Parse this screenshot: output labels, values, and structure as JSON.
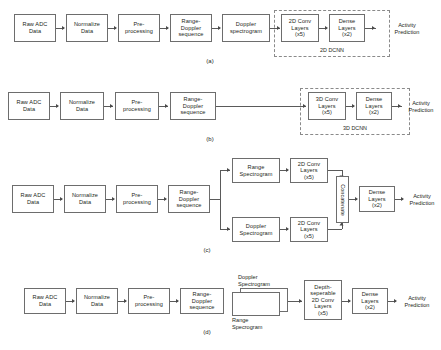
{
  "figure": {
    "background": "#ffffff",
    "box_border_color": "#6d6d6d",
    "dashed_border_color": "#8a8a8a",
    "text_color": "#231f20"
  },
  "common": {
    "raw_adc": "Raw ADC\nData",
    "normalize": "Normalize\nData",
    "preprocess": "Pre-\nprocessing",
    "rd_sequence": "Range-\nDoppler\nsequence",
    "dense_layers": "Dense\nLayers\n(x2)",
    "activity_prediction": "Activity\nPrediction"
  },
  "panel_a": {
    "caption": "(a)",
    "nodes": [
      "Raw ADC\nData",
      "Normalize\nData",
      "Pre-\nprocessing",
      "Range-\nDoppler\nsequence",
      "Doppler\nspectrogram",
      "2D Conv\nLayers\n(x5)",
      "Dense\nLayers\n(x2)"
    ],
    "output": "Activity\nPrediction",
    "group_label": "2D DCNN"
  },
  "panel_b": {
    "caption": "(b)",
    "nodes": [
      "Raw ADC\nData",
      "Normalize\nData",
      "Pre-\nprocessing",
      "Range-\nDoppler\nsequence",
      "3D Conv\nLayers\n(x5)",
      "Dense\nLayers\n(x2)"
    ],
    "output": "Activity\nPrediction",
    "group_label": "3D DCNN"
  },
  "panel_c": {
    "caption": "(c)",
    "nodes": [
      "Raw ADC\nData",
      "Normalize\nData",
      "Pre-\nprocessing",
      "Range-\nDoppler\nsequence"
    ],
    "branch_top": [
      "Range\nSpectrogram",
      "2D Conv\nLayers\n(x5)"
    ],
    "branch_bottom": [
      "Doppler\nSpectrogram",
      "2D Conv\nLayers\n(x5)"
    ],
    "merge": "Concatenate",
    "dense": "Dense\nLayers\n(x2)",
    "output": "Activity\nPrediction"
  },
  "panel_d": {
    "caption": "(d)",
    "nodes": [
      "Raw ADC\nData",
      "Normalize\nData",
      "Pre-\nprocessing",
      "Range-\nDoppler\nsequence"
    ],
    "stack_top_label": "Doppler\nSpectrogram",
    "stack_bottom_label": "Range\nSpecrogram",
    "conv": "Depth-\nseperable\n2D Conv\nLayers\n(x5)",
    "dense": "Dense\nLayers\n(x2)",
    "output": "Activity\nPrediction"
  }
}
